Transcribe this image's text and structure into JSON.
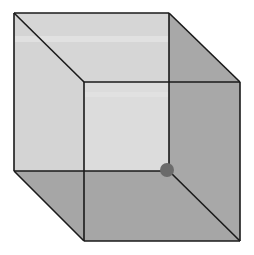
{
  "diagram": {
    "type": "wireframe-cube",
    "colors": {
      "background": "#ffffff",
      "back_face": "#d9d9d9",
      "top_face": "#d6d6d6",
      "left_face": "#d4d4d4",
      "right_face": "#a8a8a8",
      "bottom_face": "#a6a6a6",
      "front_face": "#dcdcdc",
      "edge": "#1a1a1a",
      "vertex_dot": "#6b6b6b"
    },
    "vertices": {
      "back_top_left": [
        14,
        13
      ],
      "back_top_right": [
        169,
        13
      ],
      "back_bottom_left": [
        14,
        171
      ],
      "back_bottom_right": [
        169,
        171
      ],
      "front_top_left": [
        84,
        82
      ],
      "front_top_right": [
        240,
        82
      ],
      "front_bottom_left": [
        84,
        241
      ],
      "front_bottom_right": [
        240,
        241
      ]
    },
    "highlighted_vertex": {
      "name": "back_bottom_right",
      "center": [
        167,
        170
      ],
      "radius": 7
    }
  }
}
